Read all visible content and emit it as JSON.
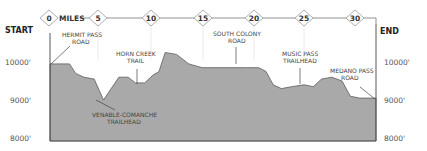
{
  "chart_data": {
    "type": "area",
    "title": "",
    "xlabel": "MILES",
    "ylabel": "",
    "x_ticks": [
      0,
      5,
      10,
      15,
      20,
      25,
      30
    ],
    "y_ticks": [
      "8000'",
      "9000'",
      "10000'"
    ],
    "ylim": [
      8000,
      10500
    ],
    "xlim": [
      0,
      31.7
    ],
    "grid": true,
    "start_label": "START",
    "end_label": "END",
    "series": [
      {
        "name": "Elevation",
        "x": [
          0,
          1.9,
          2.5,
          3.3,
          4.3,
          5.2,
          6.7,
          7.6,
          8.3,
          9.2,
          10.0,
          10.6,
          11.2,
          12.3,
          13.5,
          14.8,
          17.0,
          19.0,
          20.3,
          21.0,
          21.7,
          22.5,
          23.5,
          24.7,
          25.6,
          26.4,
          27.4,
          28.4,
          29.2,
          30.1,
          31.7
        ],
        "values": [
          9950,
          9950,
          9700,
          9600,
          9550,
          9000,
          9600,
          9600,
          9450,
          9450,
          9650,
          9750,
          10250,
          10200,
          9950,
          9850,
          9850,
          9850,
          9850,
          9750,
          9400,
          9300,
          9350,
          9400,
          9350,
          9550,
          9600,
          9500,
          9100,
          9050,
          9050
        ]
      }
    ],
    "annotations": [
      {
        "text": [
          "HERMIT PASS",
          "ROAD"
        ],
        "mile": 0.0
      },
      {
        "text": [
          "VENABLE-COMANCHE",
          "TRAILHEAD"
        ],
        "mile": 5.2
      },
      {
        "text": [
          "HORN CREEK",
          "TRAIL"
        ],
        "mile": 9.8
      },
      {
        "text": [
          "SOUTH COLONY",
          "ROAD"
        ],
        "mile": 19.0
      },
      {
        "text": [
          "MUSIC PASS",
          "TRAILHEAD"
        ],
        "mile": 25.1
      },
      {
        "text": [
          "MEDANO PASS",
          "ROAD"
        ],
        "mile": 31.7
      }
    ]
  },
  "labels": {
    "start": "START",
    "end": "END",
    "miles": "MILES",
    "y_left": [
      "10000'",
      "9000'",
      "8000'"
    ],
    "y_right": [
      "10000'",
      "9000'",
      "8000'"
    ],
    "markers": [
      "0",
      "5",
      "10",
      "15",
      "20",
      "25",
      "30"
    ],
    "hermit": [
      "HERMIT PASS",
      "ROAD"
    ],
    "venable": [
      "VENABLE-COMANCHE",
      "TRAILHEAD"
    ],
    "horn": [
      "HORN CREEK",
      "TRAIL"
    ],
    "colony": [
      "SOUTH COLONY",
      "ROAD"
    ],
    "music": [
      "MUSIC PASS",
      "TRAILHEAD"
    ],
    "medano": [
      "MEDANO PASS",
      "ROAD"
    ]
  },
  "colors": {
    "fill": "#a9a9a9",
    "stroke": "#555555",
    "grid": "#e6e6e6",
    "text": "#444444"
  }
}
